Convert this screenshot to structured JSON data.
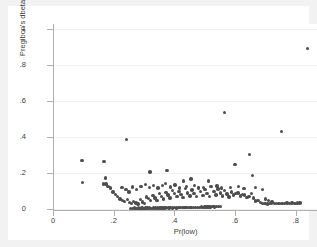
{
  "chart_data": {
    "type": "scatter",
    "title": "",
    "xlabel": "Pr(low)",
    "ylabel": "Pregibon's dbeta",
    "xlim": [
      0,
      0.87
    ],
    "ylim": [
      0,
      1.03
    ],
    "xticks": [
      0,
      0.2,
      0.4,
      0.6,
      0.8
    ],
    "xticklabels": [
      "0",
      ".2",
      ".4",
      ".6",
      ".8"
    ],
    "yticks": [
      0,
      0.2,
      0.4,
      0.6,
      0.8,
      1
    ],
    "yticklabels": [
      "0",
      ".2",
      ".4",
      ".6",
      ".8",
      "1"
    ],
    "grid": "horizontal",
    "legend": "none",
    "marker_color": "#4d4d4d",
    "background_color": "#ffffff",
    "margin_color": "#f2f2f2",
    "series": [
      {
        "name": "Pregibon's dbeta",
        "points": [
          [
            0.255,
            0.004
          ],
          [
            0.262,
            0.004
          ],
          [
            0.268,
            0.005
          ],
          [
            0.274,
            0.004
          ],
          [
            0.281,
            0.005
          ],
          [
            0.287,
            0.004
          ],
          [
            0.293,
            0.005
          ],
          [
            0.3,
            0.004
          ],
          [
            0.306,
            0.005
          ],
          [
            0.312,
            0.006
          ],
          [
            0.318,
            0.005
          ],
          [
            0.325,
            0.004
          ],
          [
            0.331,
            0.006
          ],
          [
            0.337,
            0.005
          ],
          [
            0.344,
            0.006
          ],
          [
            0.35,
            0.005
          ],
          [
            0.356,
            0.006
          ],
          [
            0.363,
            0.005
          ],
          [
            0.369,
            0.006
          ],
          [
            0.375,
            0.007
          ],
          [
            0.382,
            0.006
          ],
          [
            0.388,
            0.007
          ],
          [
            0.394,
            0.006
          ],
          [
            0.4,
            0.007
          ],
          [
            0.407,
            0.006
          ],
          [
            0.413,
            0.008
          ],
          [
            0.419,
            0.007
          ],
          [
            0.426,
            0.008
          ],
          [
            0.432,
            0.007
          ],
          [
            0.438,
            0.009
          ],
          [
            0.444,
            0.008
          ],
          [
            0.451,
            0.009
          ],
          [
            0.457,
            0.008
          ],
          [
            0.463,
            0.01
          ],
          [
            0.47,
            0.009
          ],
          [
            0.476,
            0.01
          ],
          [
            0.482,
            0.009
          ],
          [
            0.489,
            0.011
          ],
          [
            0.495,
            0.01
          ],
          [
            0.501,
            0.012
          ],
          [
            0.508,
            0.011
          ],
          [
            0.514,
            0.012
          ],
          [
            0.52,
            0.011
          ],
          [
            0.527,
            0.013
          ],
          [
            0.533,
            0.012
          ],
          [
            0.539,
            0.014
          ],
          [
            0.545,
            0.013
          ],
          [
            0.552,
            0.015
          ],
          [
            0.095,
            0.27
          ],
          [
            0.097,
            0.146
          ],
          [
            0.168,
            0.263
          ],
          [
            0.172,
            0.172
          ],
          [
            0.166,
            0.14
          ],
          [
            0.175,
            0.14
          ],
          [
            0.181,
            0.127
          ],
          [
            0.19,
            0.116
          ],
          [
            0.243,
            0.387
          ],
          [
            0.32,
            0.205
          ],
          [
            0.376,
            0.216
          ],
          [
            0.43,
            0.157
          ],
          [
            0.455,
            0.166
          ],
          [
            0.512,
            0.155
          ],
          [
            0.52,
            0.127
          ],
          [
            0.566,
            0.538
          ],
          [
            0.6,
            0.249
          ],
          [
            0.648,
            0.302
          ],
          [
            0.657,
            0.188
          ],
          [
            0.752,
            0.432
          ],
          [
            0.838,
            0.892
          ],
          [
            0.198,
            0.095
          ],
          [
            0.206,
            0.082
          ],
          [
            0.213,
            0.07
          ],
          [
            0.221,
            0.056
          ],
          [
            0.229,
            0.046
          ],
          [
            0.236,
            0.041
          ],
          [
            0.245,
            0.052
          ],
          [
            0.252,
            0.036
          ],
          [
            0.259,
            0.03
          ],
          [
            0.266,
            0.042
          ],
          [
            0.273,
            0.033
          ],
          [
            0.28,
            0.028
          ],
          [
            0.288,
            0.052
          ],
          [
            0.294,
            0.038
          ],
          [
            0.301,
            0.031
          ],
          [
            0.308,
            0.067
          ],
          [
            0.315,
            0.058
          ],
          [
            0.322,
            0.047
          ],
          [
            0.329,
            0.074
          ],
          [
            0.336,
            0.062
          ],
          [
            0.343,
            0.049
          ],
          [
            0.351,
            0.086
          ],
          [
            0.358,
            0.071
          ],
          [
            0.365,
            0.055
          ],
          [
            0.372,
            0.092
          ],
          [
            0.379,
            0.078
          ],
          [
            0.386,
            0.061
          ],
          [
            0.393,
            0.104
          ],
          [
            0.4,
            0.088
          ],
          [
            0.408,
            0.069
          ],
          [
            0.415,
            0.098
          ],
          [
            0.422,
            0.082
          ],
          [
            0.429,
            0.065
          ],
          [
            0.436,
            0.113
          ],
          [
            0.443,
            0.09
          ],
          [
            0.451,
            0.072
          ],
          [
            0.458,
            0.105
          ],
          [
            0.465,
            0.086
          ],
          [
            0.472,
            0.068
          ],
          [
            0.479,
            0.119
          ],
          [
            0.487,
            0.096
          ],
          [
            0.494,
            0.075
          ],
          [
            0.501,
            0.108
          ],
          [
            0.508,
            0.088
          ],
          [
            0.515,
            0.07
          ],
          [
            0.523,
            0.124
          ],
          [
            0.53,
            0.099
          ],
          [
            0.537,
            0.079
          ],
          [
            0.544,
            0.111
          ],
          [
            0.551,
            0.09
          ],
          [
            0.559,
            0.073
          ],
          [
            0.566,
            0.102
          ],
          [
            0.573,
            0.084
          ],
          [
            0.58,
            0.067
          ],
          [
            0.588,
            0.095
          ],
          [
            0.595,
            0.078
          ],
          [
            0.602,
            0.086
          ],
          [
            0.61,
            0.09
          ],
          [
            0.617,
            0.073
          ],
          [
            0.624,
            0.082
          ],
          [
            0.632,
            0.078
          ],
          [
            0.639,
            0.065
          ],
          [
            0.646,
            0.071
          ],
          [
            0.654,
            0.086
          ],
          [
            0.661,
            0.062
          ],
          [
            0.668,
            0.044
          ],
          [
            0.676,
            0.049
          ],
          [
            0.683,
            0.036
          ],
          [
            0.691,
            0.032
          ],
          [
            0.698,
            0.03
          ],
          [
            0.706,
            0.028
          ],
          [
            0.713,
            0.03
          ],
          [
            0.721,
            0.029
          ],
          [
            0.729,
            0.031
          ],
          [
            0.737,
            0.03
          ],
          [
            0.745,
            0.029
          ],
          [
            0.754,
            0.031
          ],
          [
            0.762,
            0.03
          ],
          [
            0.771,
            0.033
          ],
          [
            0.779,
            0.031
          ],
          [
            0.788,
            0.033
          ],
          [
            0.797,
            0.032
          ],
          [
            0.806,
            0.034
          ],
          [
            0.814,
            0.033
          ],
          [
            0.228,
            0.121
          ],
          [
            0.24,
            0.108
          ],
          [
            0.25,
            0.094
          ],
          [
            0.262,
            0.123
          ],
          [
            0.276,
            0.11
          ],
          [
            0.29,
            0.126
          ],
          [
            0.304,
            0.138
          ],
          [
            0.318,
            0.12
          ],
          [
            0.332,
            0.132
          ],
          [
            0.346,
            0.118
          ],
          [
            0.36,
            0.13
          ],
          [
            0.37,
            0.141
          ],
          [
            0.388,
            0.122
          ],
          [
            0.402,
            0.134
          ],
          [
            0.416,
            0.118
          ],
          [
            0.44,
            0.125
          ],
          [
            0.466,
            0.13
          ],
          [
            0.48,
            0.118
          ],
          [
            0.496,
            0.121
          ],
          [
            0.54,
            0.128
          ],
          [
            0.556,
            0.117
          ],
          [
            0.585,
            0.12
          ],
          [
            0.612,
            0.125
          ],
          [
            0.63,
            0.113
          ],
          [
            0.668,
            0.119
          ],
          [
            0.69,
            0.108
          ],
          [
            0.7,
            0.055
          ],
          [
            0.71,
            0.048
          ],
          [
            0.722,
            0.04
          ]
        ]
      }
    ]
  }
}
